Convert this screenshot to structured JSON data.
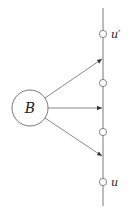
{
  "diagram": {
    "center_node": {
      "label": "B",
      "cx": 30,
      "cy": 108,
      "r": 18
    },
    "line": {
      "x": 103,
      "y1": 8,
      "y2": 206
    },
    "vertices": [
      {
        "y": 34,
        "label": "u′"
      },
      {
        "y": 83,
        "label": ""
      },
      {
        "y": 132,
        "label": ""
      },
      {
        "y": 182,
        "label": "u"
      }
    ],
    "arrows": [
      {
        "from": "B",
        "to_y": 59
      },
      {
        "from": "B",
        "to_y": 108
      },
      {
        "from": "B",
        "to_y": 156
      }
    ],
    "colors": {
      "stroke": "#6a6a6a",
      "text": "#222222"
    }
  }
}
